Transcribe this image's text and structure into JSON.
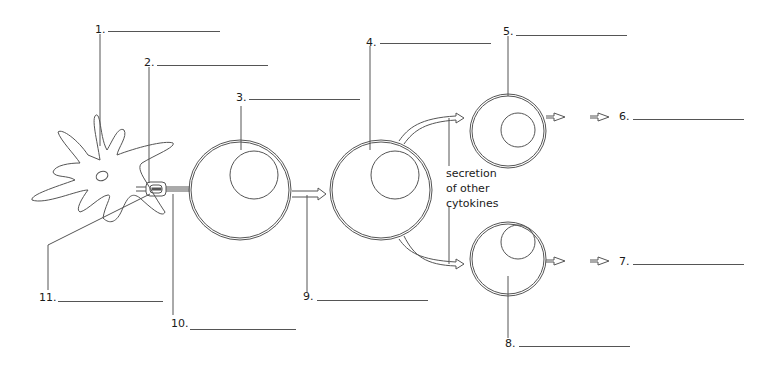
{
  "diagram": {
    "title": "",
    "labels": [
      {
        "number": "1.",
        "answer": ""
      },
      {
        "number": "2.",
        "answer": ""
      },
      {
        "number": "3.",
        "answer": ""
      },
      {
        "number": "4.",
        "answer": ""
      },
      {
        "number": "5.",
        "answer": ""
      },
      {
        "number": "6.",
        "answer": ""
      },
      {
        "number": "7.",
        "answer": ""
      },
      {
        "number": "8.",
        "answer": ""
      },
      {
        "number": "9.",
        "answer": ""
      },
      {
        "number": "10.",
        "answer": ""
      },
      {
        "number": "11.",
        "answer": ""
      }
    ],
    "annotation": {
      "line1": "secretion",
      "line2": "of other",
      "line3": "cytokines"
    },
    "colors": {
      "stroke": "#555555",
      "text": "#1a1a1a",
      "background": "#ffffff"
    }
  }
}
